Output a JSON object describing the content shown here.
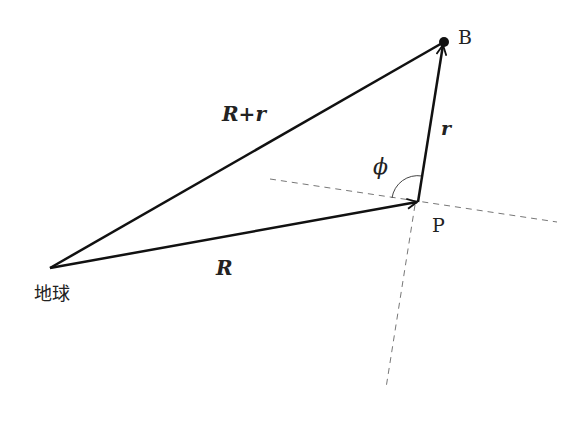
{
  "diagram": {
    "points": {
      "earth": {
        "label": "地球",
        "x": 50,
        "y": 268
      },
      "P": {
        "label": "P",
        "x": 418,
        "y": 202
      },
      "B": {
        "label": "B",
        "x": 444,
        "y": 42
      }
    },
    "vectors": {
      "R": {
        "label": "R",
        "from": "earth",
        "to": "P"
      },
      "r": {
        "label": "r",
        "from": "P",
        "to": "B"
      },
      "R_plus_r": {
        "label": "R+r",
        "from": "earth",
        "to": "B"
      }
    },
    "angle": {
      "label": "ϕ",
      "vertex": "P"
    },
    "colors": {
      "line": "#111111",
      "dashed": "#777777",
      "text": "#222222"
    }
  }
}
